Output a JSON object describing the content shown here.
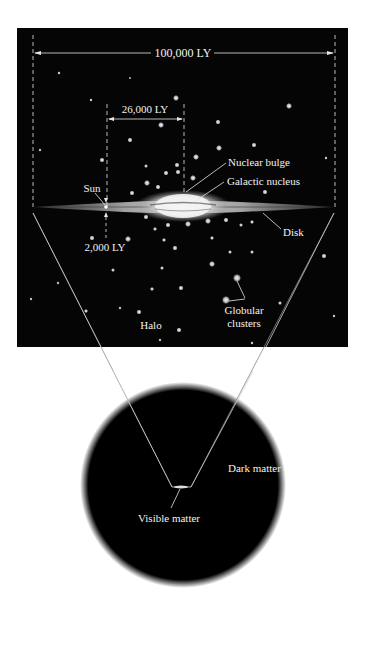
{
  "diagram": {
    "panel_top": {
      "name": "galaxy-edge-on-view",
      "background": "#050505",
      "dimensions": {
        "diameter_label": "100,000 LY",
        "sun_distance_label": "26,000 LY",
        "disk_thickness_label": "2,000 LY"
      },
      "labels": {
        "sun": "Sun",
        "nuclear_bulge": "Nuclear bulge",
        "galactic_nucleus": "Galactic nucleus",
        "disk": "Disk",
        "halo": "Halo",
        "globular_clusters_line1": "Globular",
        "globular_clusters_line2": "clusters"
      }
    },
    "panel_bottom": {
      "name": "dark-matter-halo",
      "labels": {
        "dark_matter": "Dark matter",
        "visible_matter": "Visible matter"
      }
    },
    "colors": {
      "space": "#050505",
      "text": "#f2f2f2",
      "line": "#e6e6e6",
      "page": "#ffffff"
    }
  }
}
